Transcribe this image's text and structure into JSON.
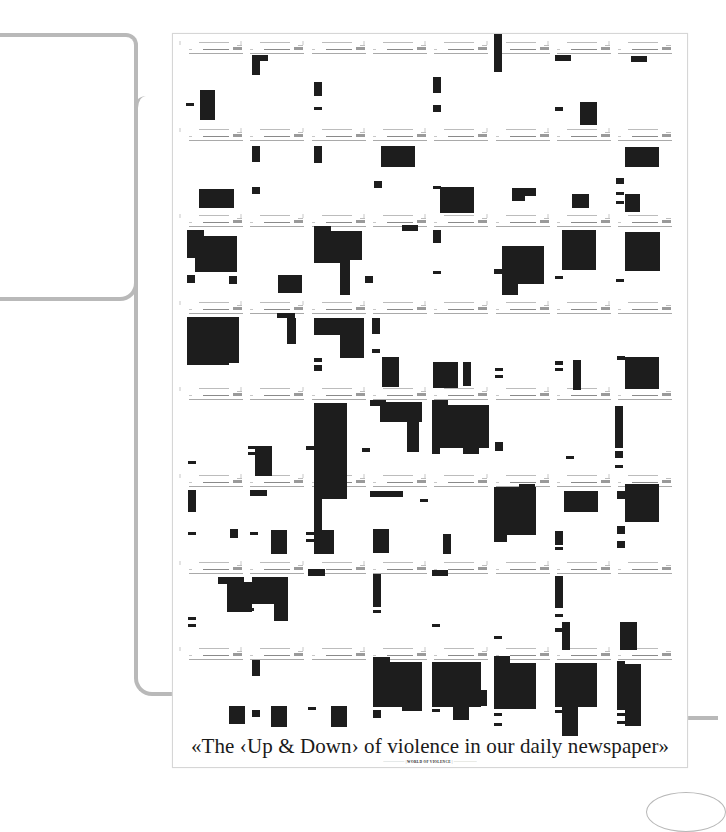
{
  "poster": {
    "title": "«The ‹Up & Down› of violence in our daily newspaper»",
    "subtitle_left": "·····················",
    "subtitle_center": "WORLD OF VIOLENCE",
    "subtitle_right": "·······················"
  },
  "chart_data": {
    "type": "heatmap",
    "title": "«The ‹Up & Down› of violence in our daily newspaper»",
    "grid": {
      "rows": 8,
      "cols": 8,
      "origin_x": 187,
      "origin_y": 40,
      "col_width": 61.3,
      "row_height": 86.6
    },
    "note": "Each cell = one daily newspaper; black rectangles mark violent-content regions. Coordinates are page px [x, y, w, h].",
    "blocks": [
      [
        200,
        90,
        15,
        30
      ],
      [
        186,
        103,
        8,
        3
      ],
      [
        252,
        57,
        8,
        18
      ],
      [
        252,
        55,
        16,
        6
      ],
      [
        314,
        82,
        8,
        14
      ],
      [
        314,
        107,
        8,
        3
      ],
      [
        433,
        77,
        8,
        16
      ],
      [
        433,
        105,
        8,
        7
      ],
      [
        494,
        34,
        8,
        38
      ],
      [
        555,
        55,
        16,
        6
      ],
      [
        555,
        107,
        8,
        4
      ],
      [
        580,
        102,
        17,
        23
      ],
      [
        631,
        56,
        16,
        6
      ],
      [
        199,
        189,
        35,
        19
      ],
      [
        252,
        146,
        8,
        16
      ],
      [
        252,
        187,
        8,
        7
      ],
      [
        314,
        146,
        8,
        17
      ],
      [
        381,
        146,
        34,
        21
      ],
      [
        374,
        181,
        8,
        7
      ],
      [
        440,
        187,
        34,
        26
      ],
      [
        433,
        186,
        8,
        3
      ],
      [
        512,
        188,
        13,
        13
      ],
      [
        512,
        188,
        24,
        8
      ],
      [
        572,
        194,
        17,
        14
      ],
      [
        625,
        147,
        34,
        20
      ],
      [
        616,
        178,
        8,
        6
      ],
      [
        616,
        192,
        8,
        3
      ],
      [
        625,
        194,
        15,
        18
      ],
      [
        616,
        201,
        8,
        3
      ],
      [
        187,
        230,
        17,
        28
      ],
      [
        195,
        236,
        42,
        36
      ],
      [
        187,
        275,
        8,
        8
      ],
      [
        229,
        276,
        8,
        8
      ],
      [
        278,
        275,
        24,
        18
      ],
      [
        278,
        275,
        16,
        12
      ],
      [
        314,
        226,
        17,
        6
      ],
      [
        314,
        231,
        48,
        29
      ],
      [
        340,
        255,
        10,
        40
      ],
      [
        314,
        251,
        30,
        12
      ],
      [
        402,
        225,
        16,
        6
      ],
      [
        365,
        276,
        8,
        7
      ],
      [
        433,
        230,
        8,
        13
      ],
      [
        433,
        271,
        8,
        3
      ],
      [
        502,
        246,
        42,
        38
      ],
      [
        494,
        269,
        8,
        5
      ],
      [
        502,
        283,
        16,
        12
      ],
      [
        562,
        230,
        34,
        40
      ],
      [
        555,
        276,
        8,
        3
      ],
      [
        625,
        232,
        35,
        39
      ],
      [
        616,
        279,
        8,
        3
      ],
      [
        187,
        317,
        52,
        46
      ],
      [
        195,
        335,
        34,
        30
      ],
      [
        187,
        362,
        9,
        3
      ],
      [
        287,
        318,
        9,
        26
      ],
      [
        277,
        313,
        18,
        5
      ],
      [
        314,
        318,
        49,
        17
      ],
      [
        340,
        318,
        24,
        40
      ],
      [
        314,
        358,
        8,
        4
      ],
      [
        314,
        365,
        8,
        6
      ],
      [
        372,
        318,
        8,
        16
      ],
      [
        372,
        349,
        8,
        4
      ],
      [
        382,
        357,
        17,
        30
      ],
      [
        433,
        362,
        25,
        26
      ],
      [
        463,
        362,
        8,
        24
      ],
      [
        433,
        362,
        8,
        4
      ],
      [
        495,
        368,
        8,
        3
      ],
      [
        495,
        375,
        8,
        3
      ],
      [
        555,
        361,
        8,
        4
      ],
      [
        555,
        368,
        8,
        3
      ],
      [
        573,
        360,
        8,
        30
      ],
      [
        625,
        357,
        34,
        32
      ],
      [
        617,
        356,
        8,
        4
      ],
      [
        188,
        461,
        8,
        3
      ],
      [
        255,
        446,
        17,
        30
      ],
      [
        248,
        446,
        12,
        3
      ],
      [
        248,
        452,
        12,
        3
      ],
      [
        314,
        403,
        33,
        96
      ],
      [
        306,
        446,
        8,
        4
      ],
      [
        370,
        400,
        16,
        6
      ],
      [
        380,
        402,
        42,
        20
      ],
      [
        407,
        402,
        12,
        50
      ],
      [
        362,
        448,
        8,
        4
      ],
      [
        432,
        400,
        16,
        6
      ],
      [
        432,
        405,
        57,
        43
      ],
      [
        463,
        440,
        16,
        14
      ],
      [
        432,
        446,
        8,
        8
      ],
      [
        495,
        442,
        8,
        9
      ],
      [
        566,
        456,
        8,
        3
      ],
      [
        615,
        406,
        8,
        42
      ],
      [
        615,
        451,
        8,
        7
      ],
      [
        615,
        465,
        8,
        3
      ],
      [
        188,
        490,
        8,
        22
      ],
      [
        188,
        532,
        8,
        3
      ],
      [
        230,
        529,
        8,
        9
      ],
      [
        250,
        490,
        17,
        6
      ],
      [
        250,
        532,
        8,
        3
      ],
      [
        271,
        530,
        16,
        24
      ],
      [
        314,
        490,
        8,
        40
      ],
      [
        306,
        532,
        8,
        3
      ],
      [
        314,
        530,
        20,
        24
      ],
      [
        306,
        539,
        8,
        3
      ],
      [
        370,
        491,
        33,
        6
      ],
      [
        373,
        529,
        16,
        24
      ],
      [
        420,
        499,
        8,
        3
      ],
      [
        443,
        534,
        8,
        20
      ],
      [
        494,
        487,
        42,
        48
      ],
      [
        494,
        502,
        13,
        40
      ],
      [
        519,
        484,
        16,
        43
      ],
      [
        564,
        491,
        34,
        21
      ],
      [
        555,
        531,
        8,
        14
      ],
      [
        555,
        547,
        8,
        3
      ],
      [
        617,
        491,
        8,
        8
      ],
      [
        625,
        484,
        34,
        38
      ],
      [
        617,
        526,
        8,
        8
      ],
      [
        617,
        541,
        8,
        7
      ],
      [
        218,
        577,
        26,
        7
      ],
      [
        227,
        582,
        25,
        30
      ],
      [
        188,
        617,
        8,
        3
      ],
      [
        188,
        624,
        8,
        3
      ],
      [
        252,
        577,
        36,
        27
      ],
      [
        274,
        577,
        14,
        44
      ],
      [
        246,
        608,
        8,
        3
      ],
      [
        308,
        569,
        17,
        7
      ],
      [
        373,
        574,
        8,
        33
      ],
      [
        373,
        610,
        8,
        3
      ],
      [
        432,
        570,
        16,
        6
      ],
      [
        432,
        624,
        8,
        3
      ],
      [
        494,
        636,
        8,
        3
      ],
      [
        555,
        576,
        8,
        32
      ],
      [
        555,
        614,
        8,
        3
      ],
      [
        562,
        622,
        8,
        28
      ],
      [
        555,
        628,
        8,
        4
      ],
      [
        620,
        622,
        17,
        28
      ],
      [
        252,
        660,
        8,
        16
      ],
      [
        229,
        706,
        16,
        18
      ],
      [
        252,
        710,
        8,
        7
      ],
      [
        271,
        706,
        16,
        21
      ],
      [
        308,
        707,
        8,
        3
      ],
      [
        331,
        706,
        16,
        21
      ],
      [
        373,
        657,
        17,
        6
      ],
      [
        373,
        662,
        49,
        45
      ],
      [
        402,
        690,
        20,
        21
      ],
      [
        373,
        710,
        8,
        8
      ],
      [
        432,
        662,
        49,
        45
      ],
      [
        432,
        709,
        8,
        3
      ],
      [
        453,
        690,
        16,
        30
      ],
      [
        479,
        690,
        8,
        16
      ],
      [
        494,
        656,
        16,
        7
      ],
      [
        494,
        663,
        42,
        46
      ],
      [
        519,
        690,
        16,
        16
      ],
      [
        494,
        713,
        8,
        3
      ],
      [
        494,
        723,
        8,
        3
      ],
      [
        555,
        663,
        42,
        44
      ],
      [
        555,
        710,
        8,
        3
      ],
      [
        562,
        706,
        16,
        30
      ],
      [
        617,
        661,
        8,
        4
      ],
      [
        617,
        664,
        24,
        46
      ],
      [
        625,
        690,
        16,
        36
      ],
      [
        617,
        713,
        8,
        3
      ],
      [
        617,
        721,
        8,
        3
      ]
    ]
  }
}
